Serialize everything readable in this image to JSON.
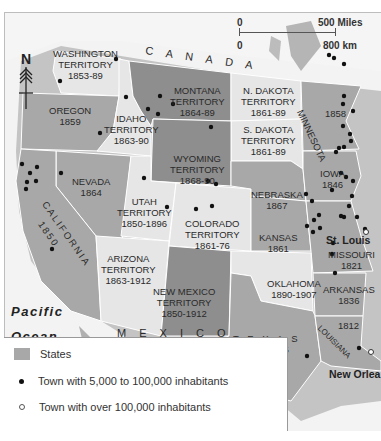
{
  "map": {
    "countries": [
      {
        "id": "canada",
        "label": "C A N A D A"
      },
      {
        "id": "mexico",
        "label": "M E X I C O"
      }
    ],
    "water": [
      {
        "id": "pacific",
        "label_line1": "Pacific",
        "label_line2": "Ocean"
      }
    ],
    "regions": [
      {
        "id": "washington",
        "name": "WASHINGTON",
        "type": "TERRITORY",
        "years": "1853-89",
        "status": "territory"
      },
      {
        "id": "oregon",
        "name": "OREGON",
        "years": "1859",
        "status": "state"
      },
      {
        "id": "idaho",
        "name": "IDAHO",
        "type": "TERRITORY",
        "years": "1863-90",
        "status": "territory"
      },
      {
        "id": "montana",
        "name": "MONTANA",
        "type": "TERRITORY",
        "years": "1864-89",
        "status": "territory-dark"
      },
      {
        "id": "ndakota",
        "name": "N. DAKOTA",
        "type": "TERRITORY",
        "years": "1861-89",
        "status": "territory"
      },
      {
        "id": "sdakota",
        "name": "S. DAKOTA",
        "type": "TERRITORY",
        "years": "1861-89",
        "status": "territory"
      },
      {
        "id": "minnesota",
        "name": "MINNESOTA",
        "years": "1858",
        "status": "state"
      },
      {
        "id": "nevada",
        "name": "NEVADA",
        "years": "1864",
        "status": "state"
      },
      {
        "id": "california",
        "name": "CALIFORNIA",
        "years": "1850",
        "status": "state"
      },
      {
        "id": "utah",
        "name": "UTAH",
        "type": "TERRITORY",
        "years": "1850-1896",
        "status": "territory"
      },
      {
        "id": "wyoming",
        "name": "WYOMING",
        "type": "TERRITORY",
        "years": "1868-90",
        "status": "territory-dark"
      },
      {
        "id": "colorado",
        "name": "COLORADO",
        "type": "TERRITORY",
        "years": "1861-76",
        "status": "territory"
      },
      {
        "id": "nebraska",
        "name": "NEBRASKA",
        "years": "1867",
        "status": "state"
      },
      {
        "id": "iowa",
        "name": "IOWA",
        "years": "1846",
        "status": "state"
      },
      {
        "id": "kansas",
        "name": "KANSAS",
        "years": "1861",
        "status": "state"
      },
      {
        "id": "missouri",
        "name": "MISSOURI",
        "years": "1821",
        "status": "state"
      },
      {
        "id": "arizona",
        "name": "ARIZONA",
        "type": "TERRITORY",
        "years": "1863-1912",
        "status": "territory"
      },
      {
        "id": "newmexico",
        "name": "NEW MEXICO",
        "type": "TERRITORY",
        "years": "1850-1912",
        "status": "territory-dark"
      },
      {
        "id": "oklahoma",
        "name": "OKLAHOMA",
        "years": "1890-1907",
        "status": "territory"
      },
      {
        "id": "arkansas",
        "name": "ARKANSAS",
        "years": "1836",
        "status": "state"
      },
      {
        "id": "texas",
        "name": "T E X A S",
        "years": "1 8 4 5",
        "status": "state"
      },
      {
        "id": "louisiana",
        "name": "LOUISIANA",
        "years": "1812",
        "status": "state"
      }
    ],
    "cities": [
      {
        "name": "St. Louis",
        "size": "large"
      },
      {
        "name": "New Orleans",
        "label_visible": "New Orlea",
        "size": "large"
      }
    ],
    "colors": {
      "state": "#a8a8a8",
      "territory": "#e6e6e6",
      "territory_dark": "#8e8e8e",
      "land": "#c4c4c4",
      "water": "#f3f3f3"
    }
  },
  "scale": {
    "miles_zero": "0",
    "miles_label": "500 Miles",
    "km_zero": "0",
    "km_label": "800 km"
  },
  "compass": {
    "label": "N"
  },
  "legend": {
    "items": [
      {
        "symbol": "swatch",
        "label": "States"
      },
      {
        "symbol": "filled-dot",
        "label": "Town with 5,000 to 100,000 inhabitants"
      },
      {
        "symbol": "open-dot",
        "label": "Town with over 100,000 inhabitants"
      }
    ]
  }
}
